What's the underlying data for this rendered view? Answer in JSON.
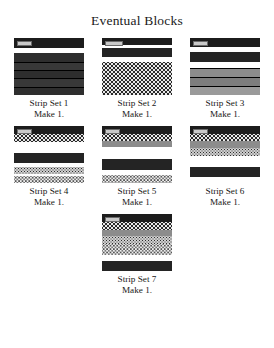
{
  "title": "Eventual Blocks",
  "blocks": [
    {
      "id": "strip-set-1",
      "name": "Strip Set 1",
      "quantity": "Make 1.",
      "bands": [
        {
          "tone": "t-black",
          "height": 9.5,
          "tag": true
        },
        {
          "tone": "t-white",
          "height": 5.5
        },
        {
          "tone": "t-dark",
          "height": 8.5
        },
        {
          "tone": "t-charcoal",
          "height": 8.0,
          "sep": true
        },
        {
          "tone": "t-dark",
          "height": 8.5,
          "sep": true
        },
        {
          "tone": "t-charcoal",
          "height": 8.5,
          "sep": true
        },
        {
          "tone": "t-dark",
          "height": 8.5,
          "sep": true
        }
      ]
    },
    {
      "id": "strip-set-2",
      "name": "Strip Set 2",
      "quantity": "Make 1.",
      "bands": [
        {
          "tone": "t-black",
          "height": 7.0,
          "tag": true,
          "tagwide": true
        },
        {
          "tone": "t-white",
          "height": 3.0
        },
        {
          "tone": "t-darkest",
          "height": 9.0
        },
        {
          "tone": "t-white",
          "height": 5.0
        },
        {
          "tone": "tx-dot-dark",
          "height": 33.0
        }
      ]
    },
    {
      "id": "strip-set-3",
      "name": "Strip Set 3",
      "quantity": "Make 1.",
      "bands": [
        {
          "tone": "t-black",
          "height": 9.0,
          "tag": true
        },
        {
          "tone": "t-white",
          "height": 5.0
        },
        {
          "tone": "t-darkest",
          "height": 9.5
        },
        {
          "tone": "t-white",
          "height": 6.0
        },
        {
          "tone": "t-gray",
          "height": 9.0,
          "sep": true
        },
        {
          "tone": "t-graymid",
          "height": 9.0,
          "sep": true
        },
        {
          "tone": "t-graylt",
          "height": 9.5,
          "sep": true
        }
      ]
    },
    {
      "id": "strip-set-4",
      "name": "Strip Set 4",
      "quantity": "Make 1.",
      "bands": [
        {
          "tone": "t-black",
          "height": 8.0,
          "tag": true
        },
        {
          "tone": "tx-dot-dark",
          "height": 7.5
        },
        {
          "tone": "t-white",
          "height": 11.0
        },
        {
          "tone": "t-darkest",
          "height": 10.0
        },
        {
          "tone": "t-white",
          "height": 4.0
        },
        {
          "tone": "tx-speck-light",
          "height": 7.0
        },
        {
          "tone": "t-white",
          "height": 2.5
        },
        {
          "tone": "tx-speck-pale",
          "height": 7.0
        }
      ]
    },
    {
      "id": "strip-set-5",
      "name": "Strip Set 5",
      "quantity": "Make 1.",
      "bands": [
        {
          "tone": "t-black",
          "height": 7.5,
          "tag": true
        },
        {
          "tone": "tx-dot-dark",
          "height": 7.5
        },
        {
          "tone": "t-gray",
          "height": 6.0
        },
        {
          "tone": "t-white",
          "height": 12.0
        },
        {
          "tone": "t-darkest",
          "height": 11.0
        },
        {
          "tone": "t-white",
          "height": 5.0
        },
        {
          "tone": "tx-speck-pale",
          "height": 8.0
        }
      ]
    },
    {
      "id": "strip-set-6",
      "name": "Strip Set 6",
      "quantity": "Make 1.",
      "bands": [
        {
          "tone": "t-black",
          "height": 7.5,
          "tag": true
        },
        {
          "tone": "tx-dot-dark",
          "height": 7.5
        },
        {
          "tone": "t-gray",
          "height": 7.0
        },
        {
          "tone": "tx-speck-light",
          "height": 8.0
        },
        {
          "tone": "t-white",
          "height": 11.0
        },
        {
          "tone": "t-darkest",
          "height": 10.0
        },
        {
          "tone": "t-white",
          "height": 6.0
        }
      ]
    },
    {
      "id": "strip-set-7",
      "name": "Strip Set 7",
      "quantity": "Make 1.",
      "bands": [
        {
          "tone": "t-black",
          "height": 8.0,
          "tag": true
        },
        {
          "tone": "tx-dot-dark",
          "height": 7.5
        },
        {
          "tone": "t-gray",
          "height": 6.5
        },
        {
          "tone": "tx-speck-light",
          "height": 8.0
        },
        {
          "tone": "tx-speck-pale",
          "height": 11.0
        },
        {
          "tone": "t-white",
          "height": 6.0
        },
        {
          "tone": "t-darkest",
          "height": 10.0
        }
      ]
    }
  ]
}
